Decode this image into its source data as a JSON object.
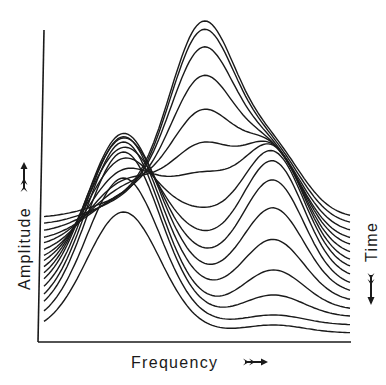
{
  "chart_data": {
    "type": "line",
    "subtype": "waterfall",
    "title": "",
    "xlabel": "Frequency",
    "ylabel": "Amplitude",
    "zlabel": "Time",
    "x_direction_icon": "double-arrow-right",
    "y_direction_icon": "double-arrow-up",
    "z_direction_icon": "double-arrow-down",
    "grid": false,
    "legend": "none",
    "ticks": false,
    "line_color": "#1a1a1a",
    "model": "each trace = baseline + three Gaussian peaks (left, middle, right); traces ordered front (earliest, index 0) to back (latest)",
    "peak_centers": {
      "left": 0.26,
      "middle": 0.52,
      "right": 0.75
    },
    "peak_widths": {
      "left": 0.12,
      "middle": 0.11,
      "right": 0.1
    },
    "series": [
      {
        "name": "t0",
        "baseline": 9,
        "left": 121,
        "middle": 0,
        "right": 8
      },
      {
        "name": "t1",
        "baseline": 17,
        "left": 147,
        "middle": 0,
        "right": 10
      },
      {
        "name": "t2",
        "baseline": 25,
        "left": 165,
        "middle": 0,
        "right": 22
      },
      {
        "name": "t3",
        "baseline": 32,
        "left": 168,
        "middle": 0,
        "right": 40
      },
      {
        "name": "t4",
        "baseline": 40,
        "left": 165,
        "middle": 5,
        "right": 62
      },
      {
        "name": "t5",
        "baseline": 48,
        "left": 160,
        "middle": 10,
        "right": 85
      },
      {
        "name": "t6",
        "baseline": 55,
        "left": 148,
        "middle": 18,
        "right": 105
      },
      {
        "name": "t7",
        "baseline": 63,
        "left": 130,
        "middle": 28,
        "right": 115
      },
      {
        "name": "t8",
        "baseline": 71,
        "left": 110,
        "middle": 45,
        "right": 115
      },
      {
        "name": "t9",
        "baseline": 78,
        "left": 90,
        "middle": 76,
        "right": 110
      },
      {
        "name": "t10",
        "baseline": 86,
        "left": 70,
        "middle": 100,
        "right": 100
      },
      {
        "name": "t11",
        "baseline": 94,
        "left": 55,
        "middle": 127,
        "right": 90
      },
      {
        "name": "t12",
        "baseline": 101,
        "left": 40,
        "middle": 156,
        "right": 80
      },
      {
        "name": "t13",
        "baseline": 109,
        "left": 30,
        "middle": 178,
        "right": 72
      },
      {
        "name": "t14",
        "baseline": 117,
        "left": 20,
        "middle": 189,
        "right": 66
      },
      {
        "name": "t15",
        "baseline": 124,
        "left": 15,
        "middle": 191,
        "right": 62
      }
    ],
    "ylim": [
      0,
      320
    ],
    "xlim": [
      0,
      1
    ]
  }
}
